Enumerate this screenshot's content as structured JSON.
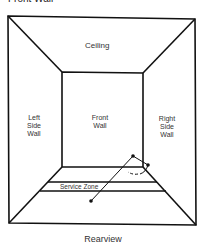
{
  "top_caption": "Front Wall",
  "labels": {
    "ceiling": "Ceiling",
    "left_wall_1": "Left",
    "left_wall_2": "Side",
    "left_wall_3": "Wall",
    "front_wall_1": "Front",
    "front_wall_2": "Wall",
    "right_wall_1": "Right",
    "right_wall_2": "Side",
    "right_wall_3": "Wall",
    "service_zone": "Service Zone"
  },
  "caption": "Rearview",
  "colors": {
    "line": "#111111",
    "text": "#333333",
    "background": "#ffffff"
  }
}
